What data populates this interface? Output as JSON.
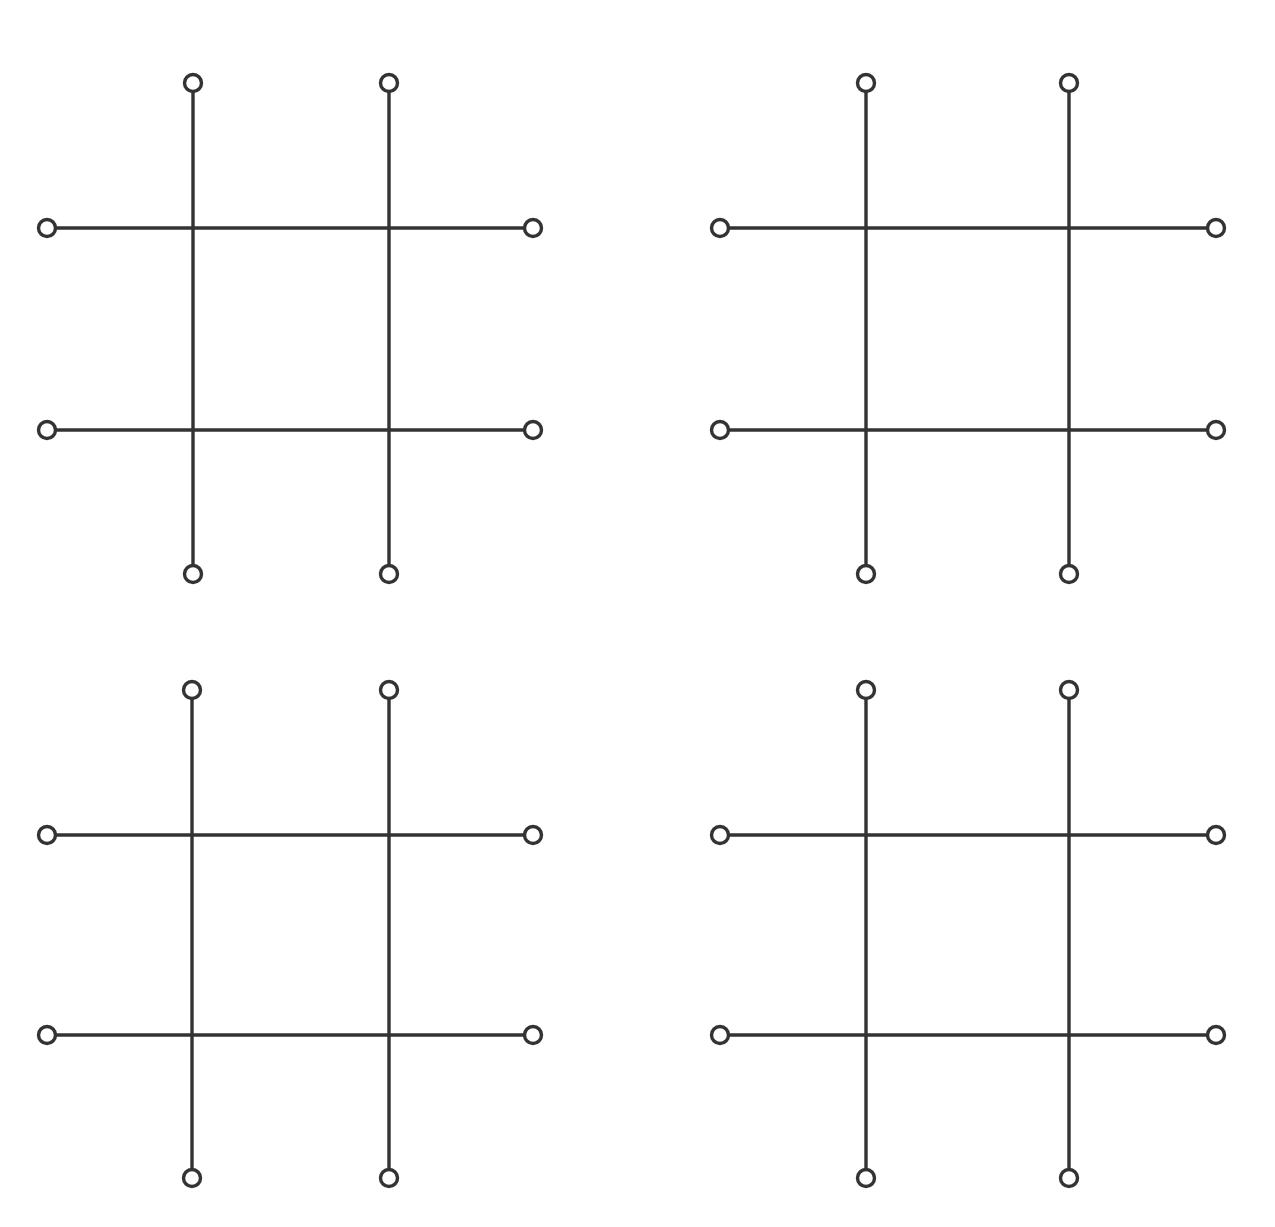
{
  "canvas": {
    "width": 1275,
    "height": 1227,
    "background_color": "#ffffff",
    "title": "Four hash-grid figures"
  },
  "style": {
    "stroke_color": "#333333",
    "line_width": 3.4,
    "node_radius": 8.5,
    "node_fill": "#ffffff",
    "node_stroke_width": 3.4
  },
  "chart_data": {
    "type": "diagram",
    "xlabel": "",
    "ylabel": "",
    "grid": false,
    "legend": null,
    "panel_count": 4,
    "panel_layout": "2 rows x 2 columns",
    "lines_per_panel": 4,
    "nodes_per_panel": 8,
    "panels": [
      {
        "id": "panel-top-left",
        "label": "Top-left hash grid",
        "vertical_x": [
          193,
          389
        ],
        "horizontal_y": [
          228,
          430
        ],
        "vertical_span_y": [
          83,
          574
        ],
        "horizontal_span_x": [
          47,
          533
        ],
        "nodes": [
          {
            "name": "top-left-vertical-top",
            "x": 193,
            "y": 83
          },
          {
            "name": "top-right-vertical-top",
            "x": 389,
            "y": 83
          },
          {
            "name": "top-left-vertical-bottom",
            "x": 193,
            "y": 574
          },
          {
            "name": "top-right-vertical-bottom",
            "x": 389,
            "y": 574
          },
          {
            "name": "upper-horizontal-left",
            "x": 47,
            "y": 228
          },
          {
            "name": "upper-horizontal-right",
            "x": 533,
            "y": 228
          },
          {
            "name": "lower-horizontal-left",
            "x": 47,
            "y": 430
          },
          {
            "name": "lower-horizontal-right",
            "x": 533,
            "y": 430
          }
        ]
      },
      {
        "id": "panel-top-right",
        "label": "Top-right hash grid",
        "vertical_x": [
          866,
          1069
        ],
        "horizontal_y": [
          228,
          430
        ],
        "vertical_span_y": [
          83,
          574
        ],
        "horizontal_span_x": [
          720,
          1216
        ],
        "nodes": [
          {
            "name": "top-left-vertical-top",
            "x": 866,
            "y": 83
          },
          {
            "name": "top-right-vertical-top",
            "x": 1069,
            "y": 83
          },
          {
            "name": "top-left-vertical-bottom",
            "x": 866,
            "y": 574
          },
          {
            "name": "top-right-vertical-bottom",
            "x": 1069,
            "y": 574
          },
          {
            "name": "upper-horizontal-left",
            "x": 720,
            "y": 228
          },
          {
            "name": "upper-horizontal-right",
            "x": 1216,
            "y": 228
          },
          {
            "name": "lower-horizontal-left",
            "x": 720,
            "y": 430
          },
          {
            "name": "lower-horizontal-right",
            "x": 1216,
            "y": 430
          }
        ]
      },
      {
        "id": "panel-bottom-left",
        "label": "Bottom-left hash grid",
        "vertical_x": [
          192,
          389
        ],
        "horizontal_y": [
          835,
          1035
        ],
        "vertical_span_y": [
          690,
          1178
        ],
        "horizontal_span_x": [
          47,
          533
        ],
        "nodes": [
          {
            "name": "top-left-vertical-top",
            "x": 192,
            "y": 690
          },
          {
            "name": "top-right-vertical-top",
            "x": 389,
            "y": 690
          },
          {
            "name": "top-left-vertical-bottom",
            "x": 192,
            "y": 1178
          },
          {
            "name": "top-right-vertical-bottom",
            "x": 389,
            "y": 1178
          },
          {
            "name": "upper-horizontal-left",
            "x": 47,
            "y": 835
          },
          {
            "name": "upper-horizontal-right",
            "x": 533,
            "y": 835
          },
          {
            "name": "lower-horizontal-left",
            "x": 47,
            "y": 1035
          },
          {
            "name": "lower-horizontal-right",
            "x": 533,
            "y": 1035
          }
        ]
      },
      {
        "id": "panel-bottom-right",
        "label": "Bottom-right hash grid",
        "vertical_x": [
          866,
          1069
        ],
        "horizontal_y": [
          835,
          1035
        ],
        "vertical_span_y": [
          690,
          1178
        ],
        "horizontal_span_x": [
          720,
          1216
        ],
        "nodes": [
          {
            "name": "top-left-vertical-top",
            "x": 866,
            "y": 690
          },
          {
            "name": "top-right-vertical-top",
            "x": 1069,
            "y": 690
          },
          {
            "name": "top-left-vertical-bottom",
            "x": 866,
            "y": 1178
          },
          {
            "name": "top-right-vertical-bottom",
            "x": 1069,
            "y": 1178
          },
          {
            "name": "upper-horizontal-left",
            "x": 720,
            "y": 835
          },
          {
            "name": "upper-horizontal-right",
            "x": 1216,
            "y": 835
          },
          {
            "name": "lower-horizontal-left",
            "x": 720,
            "y": 1035
          },
          {
            "name": "lower-horizontal-right",
            "x": 1216,
            "y": 1035
          }
        ]
      }
    ]
  }
}
